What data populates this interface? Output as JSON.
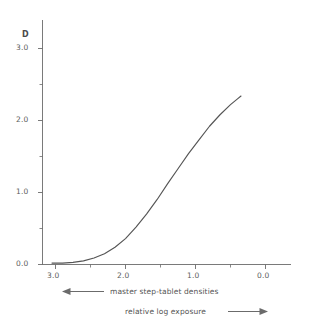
{
  "figure": {
    "background_color": "#ffffff",
    "line_color": "#555555",
    "axis_color": "#6b6b6b",
    "text_color": "#5a5a5a"
  },
  "axes": {
    "y_axis_title": "D",
    "y_tick_labels": [
      "3.0",
      "2.0",
      "1.0",
      "0.0"
    ],
    "x_tick_labels": [
      "3.0",
      "2.0",
      "1.0",
      "0.0"
    ]
  },
  "annotations": {
    "left_arrow_label": "master step-tablet densities",
    "right_arrow_label": "relative log exposure",
    "left_arrow_icon": "arrow-left-icon",
    "right_arrow_icon": "arrow-right-icon"
  },
  "chart_data": {
    "type": "line",
    "title": "",
    "subtitle": "",
    "xlabel": "relative log exposure",
    "ylabel": "D",
    "xlim": [
      3.3,
      -0.35
    ],
    "ylim": [
      0.0,
      3.35
    ],
    "x_major_ticks": [
      3.0,
      2.0,
      1.0,
      0.0
    ],
    "x_minor_ticks": [
      2.5,
      1.5,
      0.5
    ],
    "y_major_ticks": [
      3.0,
      2.0,
      1.0,
      0.0
    ],
    "y_minor_ticks": [
      2.5,
      1.5,
      0.5
    ],
    "x_axis_direction": "decreasing",
    "grid": false,
    "legend": "none",
    "series": [
      {
        "name": "characteristic curve",
        "color": "#555555",
        "x": [
          3.05,
          2.9,
          2.75,
          2.6,
          2.45,
          2.3,
          2.15,
          2.0,
          1.85,
          1.7,
          1.55,
          1.4,
          1.25,
          1.1,
          0.95,
          0.8,
          0.65,
          0.5,
          0.4,
          0.35
        ],
        "y": [
          0.02,
          0.02,
          0.03,
          0.05,
          0.09,
          0.15,
          0.24,
          0.36,
          0.52,
          0.7,
          0.9,
          1.12,
          1.33,
          1.54,
          1.73,
          1.92,
          2.08,
          2.22,
          2.3,
          2.34
        ]
      }
    ],
    "annotations": [
      {
        "text": "master step-tablet densities",
        "arrow": "left"
      },
      {
        "text": "relative log exposure",
        "arrow": "right"
      }
    ]
  }
}
